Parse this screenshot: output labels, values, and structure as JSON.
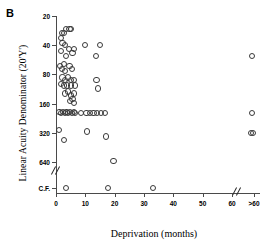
{
  "panel": {
    "letter": "B"
  },
  "axes": {
    "y": {
      "title": "Linear Acuity Denominator (20'Y')",
      "ticks": [
        "20",
        "40",
        "80",
        "160",
        "320",
        "640",
        "C.F."
      ],
      "break": true,
      "scale": "log2"
    },
    "x": {
      "title": "Deprivation (months)",
      "ticks": [
        "0",
        "10",
        "20",
        "30",
        "40",
        "50",
        "60",
        ">60"
      ],
      "break": true,
      "scale": "linear"
    }
  },
  "style": {
    "marker": "open-circle",
    "marker_color": "#3a3a3a",
    "axis_color": "#4a4a4a",
    "background": "#ffffff"
  },
  "chart_data": {
    "type": "scatter",
    "title": "B",
    "xlabel": "Deprivation (months)",
    "ylabel": "Linear Acuity Denominator (20'Y')",
    "xlim": [
      0,
      65
    ],
    "ylim_labels": [
      "20",
      "40",
      "80",
      "160",
      "320",
      "640",
      "C.F."
    ],
    "grid": false,
    "legend": false,
    "x_tick_values": [
      0,
      10,
      20,
      30,
      40,
      50,
      60,
      65
    ],
    "x_tick_labels": [
      "0",
      "10",
      "20",
      "30",
      "40",
      "50",
      "60",
      ">60"
    ],
    "y_tick_values": [
      20,
      40,
      80,
      160,
      320,
      640,
      1600
    ],
    "y_tick_labels": [
      "20",
      "40",
      "80",
      "160",
      "320",
      "640",
      "C.F."
    ],
    "axis_breaks": {
      "x_after": 62,
      "y_before": "C.F."
    },
    "series": [
      {
        "name": "Patients",
        "marker": "open-circle",
        "points": [
          [
            2.0,
            30
          ],
          [
            2.6,
            30
          ],
          [
            3.4,
            27
          ],
          [
            4.6,
            27
          ],
          [
            5.2,
            27
          ],
          [
            1.6,
            34
          ],
          [
            2.2,
            38
          ],
          [
            3.0,
            40
          ],
          [
            4.4,
            44
          ],
          [
            6.2,
            44
          ],
          [
            9.8,
            40
          ],
          [
            15.0,
            40
          ],
          [
            1.8,
            46
          ],
          [
            3.4,
            52
          ],
          [
            5.6,
            48
          ],
          [
            13.5,
            52
          ],
          [
            1.4,
            66
          ],
          [
            2.0,
            70
          ],
          [
            2.6,
            62
          ],
          [
            3.2,
            74
          ],
          [
            4.6,
            66
          ],
          [
            5.4,
            70
          ],
          [
            2.2,
            86
          ],
          [
            3.0,
            92
          ],
          [
            4.0,
            86
          ],
          [
            5.0,
            92
          ],
          [
            6.0,
            92
          ],
          [
            1.8,
            100
          ],
          [
            2.8,
            104
          ],
          [
            3.8,
            104
          ],
          [
            5.0,
            104
          ],
          [
            6.4,
            104
          ],
          [
            13.8,
            92
          ],
          [
            14.2,
            112
          ],
          [
            3.2,
            126
          ],
          [
            4.2,
            120
          ],
          [
            5.2,
            132
          ],
          [
            6.2,
            126
          ],
          [
            4.8,
            150
          ],
          [
            5.6,
            144
          ],
          [
            6.0,
            158
          ],
          [
            1.2,
            196
          ],
          [
            1.8,
            200
          ],
          [
            2.4,
            196
          ],
          [
            3.0,
            200
          ],
          [
            3.6,
            196
          ],
          [
            4.2,
            200
          ],
          [
            4.8,
            196
          ],
          [
            5.4,
            200
          ],
          [
            6.0,
            196
          ],
          [
            6.6,
            200
          ],
          [
            8.6,
            200
          ],
          [
            10.4,
            200
          ],
          [
            11.6,
            200
          ],
          [
            12.8,
            200
          ],
          [
            14.0,
            200
          ],
          [
            15.4,
            200
          ],
          [
            16.8,
            200
          ],
          [
            0.9,
            300
          ],
          [
            2.6,
            380
          ],
          [
            10.6,
            310
          ],
          [
            17.0,
            350
          ],
          [
            19.6,
            620
          ],
          [
            3.4,
            1600
          ],
          [
            17.8,
            1600
          ],
          [
            33.0,
            1600
          ],
          [
            64.5,
            52
          ],
          [
            64.5,
            200
          ],
          [
            64.2,
            320
          ],
          [
            64.8,
            320
          ]
        ]
      }
    ],
    "n_points": 69
  }
}
